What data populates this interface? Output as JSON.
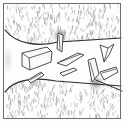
{
  "figure": {
    "title": "Line-art sketch of a layered rock fabric",
    "caption": "",
    "canvas": {
      "width": 124,
      "height": 122
    },
    "background_color": "#fdfdfd",
    "ink_color": "#3a3a3a",
    "shading_color": "#8c8c8c",
    "smudge_color": "#707070",
    "frame": {
      "name": "drawing-border",
      "stroke": "#6e6e6e",
      "stroke_width": 1,
      "x": 3,
      "y": 3,
      "width": 117,
      "height": 116
    },
    "bands": [
      {
        "id": "upper-textured-band",
        "label": "Upper stippled matrix band",
        "fill": "#ffffff",
        "texture": "fine-stipple",
        "texture_color": "#9a9a9a",
        "y_top": 6,
        "y_bottom": 40
      },
      {
        "id": "middle-clear-band",
        "label": "Middle clear band with elongate grains",
        "fill": "#ffffff",
        "texture": "none",
        "y_top": 38,
        "y_bottom": 84
      },
      {
        "id": "lower-textured-band",
        "label": "Lower stippled matrix band",
        "fill": "#ffffff",
        "texture": "fine-stipple",
        "texture_color": "#9a9a9a",
        "y_top": 84,
        "y_bottom": 117
      }
    ],
    "contacts": [
      {
        "id": "upper-contact-line",
        "label": "Upper band contact curve",
        "stroke": "#2e2e2e",
        "stroke_width": 1.2,
        "path": "M 5 30 C 16 44 38 47 58 42 L 121 38"
      },
      {
        "id": "lower-contact-line",
        "label": "Lower band contact curve",
        "stroke": "#2e2e2e",
        "stroke_width": 1.2,
        "path": "M 5 92 C 14 79 36 77 56 81 L 121 86"
      },
      {
        "id": "lower-right-tail-line",
        "label": "Lower right trailing line",
        "stroke": "#2e2e2e",
        "stroke_width": 1,
        "path": "M 96 80 L 122 91"
      }
    ],
    "smudges": [
      {
        "id": "smudge-upper-mid",
        "label": "Dark shading at upper contact",
        "cx": 60,
        "cy": 36,
        "rx": 8,
        "ry": 9,
        "opacity": 0.55
      },
      {
        "id": "smudge-lower-right",
        "label": "Dark shading at lower right contact",
        "cx": 96,
        "cy": 83,
        "rx": 9,
        "ry": 8,
        "opacity": 0.5
      },
      {
        "id": "smudge-lower-left",
        "label": "Dark shading at lower left contact",
        "cx": 34,
        "cy": 83,
        "rx": 7,
        "ry": 5,
        "opacity": 0.3
      },
      {
        "id": "smudge-left-edge",
        "label": "Soft shading at left edge",
        "cx": 8,
        "cy": 60,
        "rx": 5,
        "ry": 14,
        "opacity": 0.18
      }
    ],
    "grains": [
      {
        "id": "grain-block-left",
        "label": "Large tabular block grain, left",
        "kind": "tabular-block",
        "stroke": "#3a3a3a",
        "fill": "#fafafa",
        "outline": "M 22 53 L 47 47 L 52 52 L 51 62 L 30 70 L 22 66 Z",
        "facets": [
          "M 22 53 L 29 58 L 51 51",
          "M 29 58 L 30 70",
          "M 47 47 L 52 52"
        ]
      },
      {
        "id": "grain-sliver-upper-center",
        "label": "Vertical sliver grain at upper contact",
        "kind": "sliver",
        "stroke": "#3a3a3a",
        "fill": "#f7f7f7",
        "outline": "M 58 33 L 63 35 L 62 52 L 57 49 Z",
        "facets": [
          "M 59 35 L 60 50"
        ]
      },
      {
        "id": "grain-lath-center",
        "label": "Long lath grain, centre",
        "kind": "lath",
        "stroke": "#3a3a3a",
        "fill": "#f7f7f7",
        "outline": "M 57 63 L 78 53 L 84 55 L 66 66 Z",
        "facets": [
          "M 60 62 L 81 54"
        ]
      },
      {
        "id": "grain-lath-lower-center",
        "label": "Small lath grain, lower centre",
        "kind": "lath",
        "stroke": "#3a3a3a",
        "fill": "#f7f7f7",
        "outline": "M 60 73 L 74 68 L 77 70 L 63 76 Z",
        "facets": []
      },
      {
        "id": "grain-needle-left-lower",
        "label": "Needle grain pointing to lower left contact",
        "kind": "needle",
        "stroke": "#3a3a3a",
        "fill": "#f7f7f7",
        "outline": "M 28 80 L 41 72 L 44 75 L 31 83 Z",
        "facets": [
          "M 30 80 L 42 73"
        ]
      },
      {
        "id": "grain-chevron-right",
        "label": "Chevron / V-shaped grain, upper right",
        "kind": "chevron",
        "stroke": "#3a3a3a",
        "fill": "#fafafa",
        "outline": "M 100 45 L 108 48 L 114 44 L 109 55 L 104 62 L 102 53 Z",
        "facets": [
          "M 104 62 L 108 48"
        ]
      },
      {
        "id": "grain-blade-right",
        "label": "Blade grain at lower right contact",
        "kind": "blade",
        "stroke": "#3a3a3a",
        "fill": "#f7f7f7",
        "outline": "M 88 60 L 95 58 L 99 74 L 92 82 Z",
        "facets": [
          "M 90 62 L 95 80"
        ]
      },
      {
        "id": "grain-wedge-lower-right",
        "label": "Wedge grain, lower right",
        "kind": "wedge",
        "stroke": "#3a3a3a",
        "fill": "#fafafa",
        "outline": "M 100 72 L 116 67 L 118 72 L 104 80 Z",
        "facets": [
          "M 102 73 L 116 69"
        ]
      }
    ],
    "texture_seed": {
      "upper_marks": 320,
      "lower_marks": 300,
      "mark_length": 3,
      "mark_width": 1
    }
  }
}
